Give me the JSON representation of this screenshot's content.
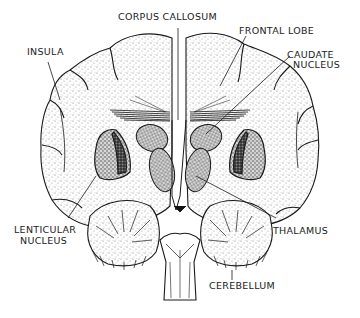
{
  "diagram": {
    "labels": {
      "corpus_callosum": "CORPUS CALLOSUM",
      "frontal_lobe": "FRONTAL LOBE",
      "insula": "INSULA",
      "caudate_line1": "CAUDATE",
      "caudate_line2": "NUCLEUS",
      "lenticular_line1": "LENTICULAR",
      "lenticular_line2": "NUCLEUS",
      "thalamus": "THALAMUS",
      "cerebellum": "CEREBELLUM"
    },
    "colors": {
      "ink": "#1a1a1a",
      "stipple": "#8a8a8a",
      "background": "#ffffff"
    }
  }
}
